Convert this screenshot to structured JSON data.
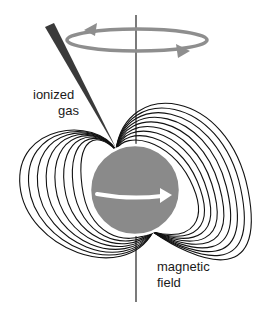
{
  "labels": {
    "ionized_gas_line1": "ionized",
    "ionized_gas_line2": "gas",
    "magnetic_field_line1": "magnetic",
    "magnetic_field_line2": "field"
  },
  "colors": {
    "star": "#8a8a8a",
    "rotation_ring": "#8e8e8e",
    "gas_beam": "#3a3a3a",
    "field_lines": "#111111",
    "axis": "#222222",
    "spin_arrow": "#ffffff"
  },
  "icons": {
    "rotation": "rotation-arrow-icon",
    "spin": "spin-arrow-icon"
  },
  "field_line_counts": {
    "left": 8,
    "right": 9
  }
}
